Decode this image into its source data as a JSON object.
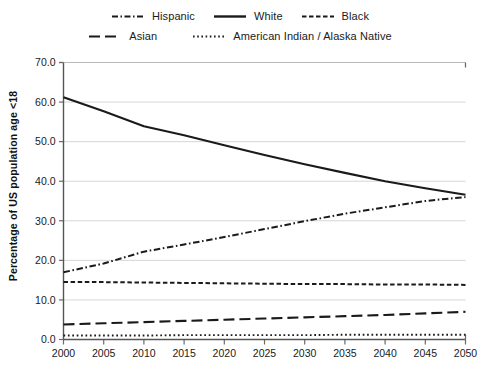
{
  "chart_data": {
    "type": "line",
    "title": "",
    "subtitle": "",
    "xlabel": "",
    "ylabel": "Percentage of US population age <18",
    "xlim": [
      2000,
      2050
    ],
    "ylim": [
      0.0,
      70.0
    ],
    "ytick_step": 10.0,
    "xtick_step": 5,
    "grid": "horizontal",
    "legend_position": "top",
    "x": [
      2000,
      2005,
      2010,
      2015,
      2020,
      2025,
      2030,
      2035,
      2040,
      2045,
      2050
    ],
    "xtick_labels": [
      "2000",
      "2005",
      "2010",
      "2015",
      "2020",
      "2025",
      "2030",
      "2035",
      "2040",
      "2045",
      "2050"
    ],
    "ytick_labels": [
      "0.0",
      "10.0",
      "20.0",
      "30.0",
      "40.0",
      "50.0",
      "60.0",
      "70.0"
    ],
    "series": [
      {
        "name": "Hispanic",
        "style": "dash-dot",
        "color": "#1a1a1a",
        "values": [
          17.0,
          19.2,
          22.2,
          24.0,
          25.9,
          27.9,
          29.9,
          31.8,
          33.4,
          35.0,
          36.0
        ]
      },
      {
        "name": "White",
        "style": "solid",
        "color": "#1a1a1a",
        "values": [
          61.2,
          57.7,
          53.9,
          51.6,
          49.1,
          46.6,
          44.3,
          42.1,
          40.0,
          38.2,
          36.6
        ]
      },
      {
        "name": "Black",
        "style": "dashed",
        "color": "#1a1a1a",
        "values": [
          14.5,
          14.5,
          14.4,
          14.3,
          14.2,
          14.1,
          14.0,
          14.0,
          13.9,
          13.9,
          13.8
        ]
      },
      {
        "name": "Asian",
        "style": "long-dash",
        "color": "#1a1a1a",
        "values": [
          3.8,
          4.1,
          4.4,
          4.7,
          5.0,
          5.3,
          5.6,
          5.9,
          6.2,
          6.6,
          7.0
        ]
      },
      {
        "name": "American Indian / Alaska Native",
        "style": "dotted",
        "color": "#1a1a1a",
        "values": [
          1.0,
          1.0,
          1.0,
          1.1,
          1.1,
          1.1,
          1.1,
          1.2,
          1.2,
          1.2,
          1.2
        ]
      }
    ]
  },
  "legend": {
    "row1": [
      {
        "label": "Hispanic",
        "style": "dash-dot"
      },
      {
        "label": "White",
        "style": "solid"
      },
      {
        "label": "Black",
        "style": "dashed"
      }
    ],
    "row2": [
      {
        "label": "Asian",
        "style": "long-dash"
      },
      {
        "label": "American Indian / Alaska Native",
        "style": "dotted"
      }
    ]
  },
  "axis": {
    "y_title": "Percentage of US population age <18"
  }
}
